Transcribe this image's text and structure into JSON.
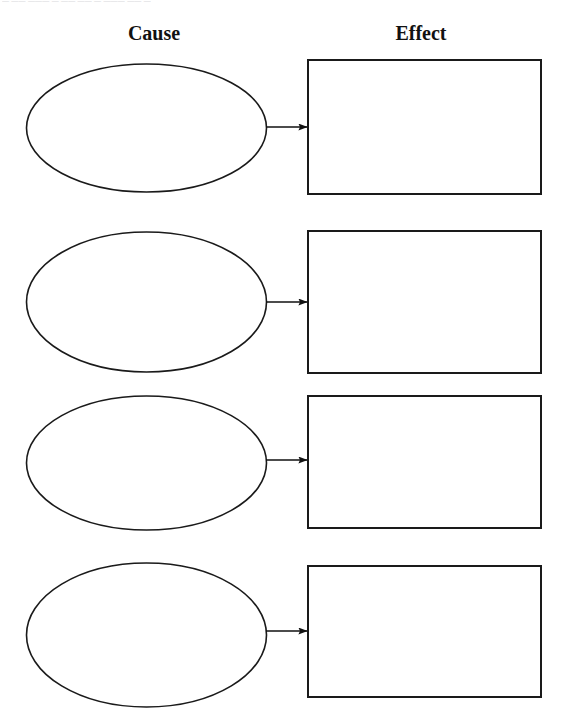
{
  "page": {
    "width": 562,
    "height": 717,
    "background_color": "#ffffff",
    "stroke_color": "#1a1a1a",
    "top_text_fragment": "— —— ——— — —— —— — ——— —— —"
  },
  "headings": {
    "cause": "Cause",
    "effect": "Effect"
  },
  "diagram": {
    "type": "cause-effect-organizer",
    "row_count": 4,
    "cause_shape": "ellipse",
    "effect_shape": "rectangle",
    "connector": "arrow",
    "rows": [
      {
        "index": 1,
        "cause_text": "",
        "effect_text": "",
        "cause": {
          "cx": 146.5,
          "cy": 128,
          "rx": 120,
          "ry": 64
        },
        "effect": {
          "x": 308,
          "y": 60,
          "w": 233,
          "h": 134
        },
        "arrow": {
          "x1": 266,
          "y1": 127,
          "x2": 307,
          "y2": 127
        }
      },
      {
        "index": 2,
        "cause_text": "",
        "effect_text": "",
        "cause": {
          "cx": 146.5,
          "cy": 302,
          "rx": 120,
          "ry": 70
        },
        "effect": {
          "x": 308,
          "y": 231,
          "w": 233,
          "h": 142
        },
        "arrow": {
          "x1": 266,
          "y1": 302,
          "x2": 307,
          "y2": 302
        }
      },
      {
        "index": 3,
        "cause_text": "",
        "effect_text": "",
        "cause": {
          "cx": 146.5,
          "cy": 463,
          "rx": 120,
          "ry": 67
        },
        "effect": {
          "x": 308,
          "y": 396,
          "w": 233,
          "h": 132
        },
        "arrow": {
          "x1": 266,
          "y1": 460,
          "x2": 307,
          "y2": 460
        }
      },
      {
        "index": 4,
        "cause_text": "",
        "effect_text": "",
        "cause": {
          "cx": 146.5,
          "cy": 635,
          "rx": 120,
          "ry": 72
        },
        "effect": {
          "x": 308,
          "y": 566,
          "w": 233,
          "h": 131
        },
        "arrow": {
          "x1": 266,
          "y1": 631,
          "x2": 307,
          "y2": 631
        }
      }
    ]
  }
}
